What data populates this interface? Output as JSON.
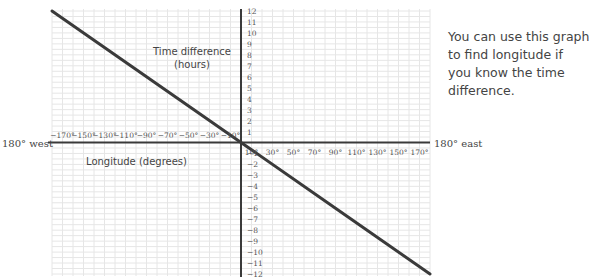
{
  "chart_data": {
    "type": "line",
    "title": "",
    "xlabel": "Longitude (degrees)",
    "ylabel": "Time difference (hours)",
    "ylabel_lines": [
      "Time difference",
      "(hours)"
    ],
    "xlim": [
      -180,
      180
    ],
    "ylim": [
      -12,
      12
    ],
    "grid": true,
    "x_end_labels": {
      "left": "180° west",
      "right": "180° east"
    },
    "x_ticks_negative": [
      "−170°",
      "−150°",
      "−130°",
      "−110°",
      "−90°",
      "−70°",
      "−50°",
      "−30°",
      "−10°"
    ],
    "x_ticks_negative_values": [
      -170,
      -150,
      -130,
      -110,
      -90,
      -70,
      -50,
      -30,
      -10
    ],
    "x_ticks_positive": [
      "10°",
      "30°",
      "50°",
      "70°",
      "90°",
      "110°",
      "130°",
      "150°",
      "170°"
    ],
    "x_ticks_positive_values": [
      10,
      30,
      50,
      70,
      90,
      110,
      130,
      150,
      170
    ],
    "y_ticks": [
      12,
      11,
      10,
      9,
      8,
      7,
      6,
      5,
      4,
      3,
      2,
      1,
      -1,
      -2,
      -3,
      -4,
      -5,
      -6,
      -7,
      -8,
      -9,
      -10,
      -11,
      -12
    ],
    "y_tick_labels": [
      "12",
      "11",
      "10",
      "9",
      "8",
      "7",
      "6",
      "5",
      "4",
      "3",
      "2",
      "1",
      "−1",
      "−2",
      "−3",
      "−4",
      "−5",
      "−6",
      "−7",
      "−8",
      "−9",
      "−10",
      "−11",
      "−12"
    ],
    "series": [
      {
        "name": "Time difference vs longitude",
        "x": [
          -180,
          -90,
          0,
          90,
          180
        ],
        "y": [
          12,
          6,
          0,
          -6,
          -12
        ]
      }
    ]
  },
  "note": {
    "lines": [
      "You can use this graph",
      "to find longitude if",
      "you know the time",
      "difference."
    ]
  }
}
